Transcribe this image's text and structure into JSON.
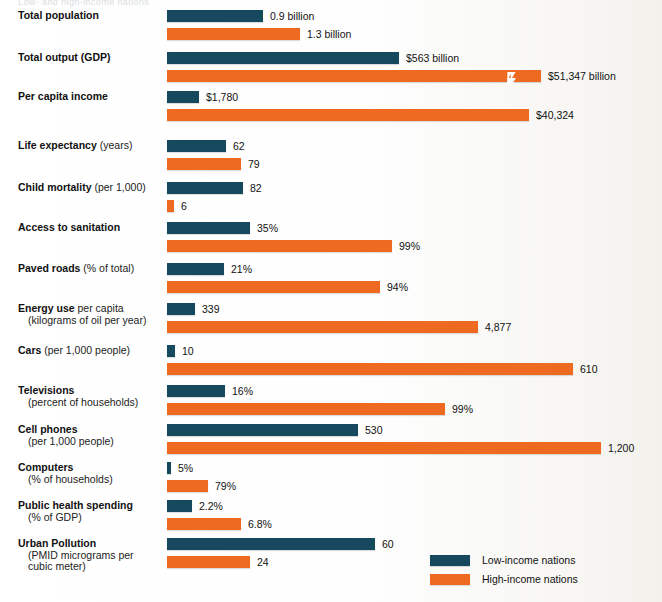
{
  "page": {
    "ghost_title": "Low- and high-income nations",
    "bar_origin_x": 167,
    "colors": {
      "low": "#16485e",
      "high": "#ee6a21",
      "background": "#fdfdfc",
      "text": "#111111"
    }
  },
  "legend": {
    "items": [
      {
        "label": "Low-income nations",
        "color": "#16485e",
        "key": "low"
      },
      {
        "label": "High-income nations",
        "color": "#ee6a21",
        "key": "high"
      }
    ]
  },
  "chart_data": {
    "type": "bar",
    "orientation": "horizontal",
    "title": "Low- and high-income nations",
    "xlabel": "",
    "ylabel": "",
    "grid": false,
    "legend_position": "bottom-right",
    "series": [
      {
        "name": "Low-income nations",
        "color": "#16485e"
      },
      {
        "name": "High-income nations",
        "color": "#ee6a21"
      }
    ],
    "note": "Each indicator is scaled independently; bar lengths are not on a single shared axis. The GDP high-income bar carries a break mark.",
    "categories": [
      "Total population",
      "Total output (GDP)",
      "Per capita income",
      "Life expectancy (years)",
      "Child mortality (per 1,000)",
      "Access to sanitation",
      "Paved roads (% of total)",
      "Energy use per capita (kilograms of oil per year)",
      "Cars (per 1,000 people)",
      "Televisions (percent of households)",
      "Cell phones (per 1,000 people)",
      "Computers (% of households)",
      "Public health spending (% of GDP)",
      "Urban Pollution (PMID micrograms per cubic meter)"
    ],
    "rows": [
      {
        "label_bold": "Total population",
        "label_rest": "",
        "label_line2": "",
        "top": 10,
        "low": {
          "value": "0.9 billion",
          "width": 96,
          "break": false
        },
        "high": {
          "value": "1.3 billion",
          "width": 133,
          "break": false
        }
      },
      {
        "label_bold": "Total output (GDP)",
        "label_rest": "",
        "label_line2": "",
        "top": 52,
        "low": {
          "value": "$563 billion",
          "width": 232,
          "break": false
        },
        "high": {
          "value": "$51,347 billion",
          "width": 374,
          "break": true,
          "break_x": 340
        }
      },
      {
        "label_bold": "Per capita income",
        "label_rest": "",
        "label_line2": "",
        "top": 91,
        "low": {
          "value": "$1,780",
          "width": 32,
          "break": false
        },
        "high": {
          "value": "$40,324",
          "width": 362,
          "break": false
        }
      },
      {
        "label_bold": "Life expectancy",
        "label_rest": " (years)",
        "label_line2": "",
        "top": 140,
        "low": {
          "value": "62",
          "width": 59,
          "break": false
        },
        "high": {
          "value": "79",
          "width": 74,
          "break": false
        }
      },
      {
        "label_bold": "Child mortality",
        "label_rest": " (per 1,000)",
        "label_line2": "",
        "top": 182,
        "low": {
          "value": "82",
          "width": 76,
          "break": false
        },
        "high": {
          "value": "6",
          "width": 7,
          "break": false
        }
      },
      {
        "label_bold": "Access to sanitation",
        "label_rest": "",
        "label_line2": "",
        "top": 222,
        "low": {
          "value": "35%",
          "width": 83,
          "break": false
        },
        "high": {
          "value": "99%",
          "width": 225,
          "break": false
        }
      },
      {
        "label_bold": "Paved roads",
        "label_rest": " (% of total)",
        "label_line2": "",
        "top": 263,
        "low": {
          "value": "21%",
          "width": 57,
          "break": false
        },
        "high": {
          "value": "94%",
          "width": 213,
          "break": false
        }
      },
      {
        "label_bold": "Energy use",
        "label_rest": " per capita",
        "label_line2": "(kilograms of oil per year)",
        "top": 303,
        "low": {
          "value": "339",
          "width": 28,
          "break": false
        },
        "high": {
          "value": "4,877",
          "width": 311,
          "break": false
        }
      },
      {
        "label_bold": "Cars",
        "label_rest": " (per 1,000 people)",
        "label_line2": "",
        "top": 345,
        "low": {
          "value": "10",
          "width": 8,
          "break": false
        },
        "high": {
          "value": "610",
          "width": 406,
          "break": false
        }
      },
      {
        "label_bold": "Televisions",
        "label_rest": "",
        "label_line2": "(percent of households)",
        "top": 385,
        "low": {
          "value": "16%",
          "width": 58,
          "break": false
        },
        "high": {
          "value": "99%",
          "width": 278,
          "break": false
        }
      },
      {
        "label_bold": "Cell phones",
        "label_rest": "",
        "label_line2": "(per 1,000 people)",
        "top": 424,
        "low": {
          "value": "530",
          "width": 191,
          "break": false
        },
        "high": {
          "value": "1,200",
          "width": 434,
          "break": false
        }
      },
      {
        "label_bold": "Computers",
        "label_rest": "",
        "label_line2": "(% of households)",
        "top": 462,
        "low": {
          "value": "5%",
          "width": 4,
          "break": false
        },
        "high": {
          "value": "79%",
          "width": 41,
          "break": false
        }
      },
      {
        "label_bold": "Public health spending",
        "label_rest": "",
        "label_line2": "(% of GDP)",
        "top": 500,
        "low": {
          "value": "2.2%",
          "width": 25,
          "break": false
        },
        "high": {
          "value": "6.8%",
          "width": 74,
          "break": false
        }
      },
      {
        "label_bold": "Urban Pollution",
        "label_rest": "",
        "label_line2": "(PMID micrograms per",
        "label_line3": "cubic meter)",
        "top": 538,
        "low": {
          "value": "60",
          "width": 208,
          "break": false
        },
        "high": {
          "value": "24",
          "width": 83,
          "break": false
        }
      }
    ]
  }
}
